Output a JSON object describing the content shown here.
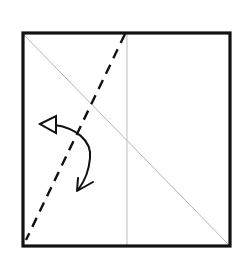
{
  "diagram": {
    "type": "origami-fold-step",
    "paper": {
      "x": 22,
      "y": 32,
      "width": 209,
      "height": 215,
      "stroke": "#111111"
    },
    "creases": [
      {
        "name": "diagonal-crease",
        "x1": 22,
        "y1": 33,
        "x2": 230,
        "y2": 246,
        "stroke": "#bbbbbb"
      },
      {
        "name": "center-vertical-crease",
        "x1": 127,
        "y1": 33,
        "x2": 127,
        "y2": 246,
        "stroke": "#bbbbbb"
      }
    ],
    "fold_line": {
      "name": "valley-fold-line",
      "x1": 125,
      "y1": 33,
      "x2": 26,
      "y2": 240,
      "style": "dashed",
      "stroke": "#111111"
    },
    "arrow": {
      "name": "fold-arrow",
      "direction": "fold-over-and-back",
      "stroke": "#111111"
    }
  }
}
